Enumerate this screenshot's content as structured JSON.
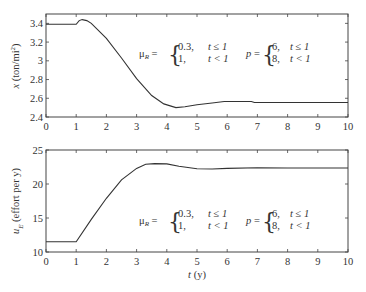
{
  "chart_data": [
    {
      "type": "line",
      "title": "",
      "xlabel": "",
      "ylabel": "x (ton/mi²)",
      "ylabel_main": "x",
      "ylabel_unit": " (ton/mi",
      "ylabel_sup": "2",
      "ylabel_close": ")",
      "xlim": [
        0,
        10
      ],
      "ylim": [
        2.4,
        3.5
      ],
      "xticks": [
        0,
        1,
        2,
        3,
        4,
        5,
        6,
        7,
        8,
        9,
        10
      ],
      "xtick_labels": [
        "0",
        "1",
        "2",
        "3",
        "4",
        "5",
        "6",
        "7",
        "8",
        "9",
        "10"
      ],
      "yticks": [
        2.4,
        2.6,
        2.8,
        3.0,
        3.2,
        3.4
      ],
      "ytick_labels": [
        "2.4",
        "2.6",
        "2.8",
        "3",
        "3.2",
        "3.4"
      ],
      "grid": false,
      "series": [
        {
          "name": "x",
          "x": [
            0,
            1.0,
            1.1,
            1.2,
            1.35,
            1.5,
            2.0,
            2.5,
            3.0,
            3.5,
            3.9,
            4.3,
            4.6,
            5.0,
            5.5,
            5.9,
            6.8,
            6.9,
            10
          ],
          "y": [
            3.39,
            3.39,
            3.43,
            3.44,
            3.43,
            3.4,
            3.24,
            3.03,
            2.81,
            2.63,
            2.54,
            2.5,
            2.51,
            2.53,
            2.55,
            2.565,
            2.565,
            2.555,
            2.555
          ]
        }
      ],
      "annotations": {
        "mu_label": "μ",
        "mu_sub": "R",
        "mu_eq": " =",
        "mu_cases": [
          [
            "0.3,",
            "t ≤ 1"
          ],
          [
            "1,",
            "t < 1"
          ]
        ],
        "p_label": "p",
        "p_eq": " =",
        "p_cases": [
          [
            "6,",
            "t ≤ 1"
          ],
          [
            "8,",
            "t < 1"
          ]
        ]
      }
    },
    {
      "type": "line",
      "title": "",
      "xlabel": "t (y)",
      "xlabel_var": "t",
      "xlabel_unit": " (y)",
      "ylabel": "u_E (effort per y)",
      "ylabel_main": "u",
      "ylabel_sub": "E",
      "ylabel_unit": " (effort per y)",
      "xlim": [
        0,
        10
      ],
      "ylim": [
        10,
        25
      ],
      "xticks": [
        0,
        1,
        2,
        3,
        4,
        5,
        6,
        7,
        8,
        9,
        10
      ],
      "xtick_labels": [
        "0",
        "1",
        "2",
        "3",
        "4",
        "5",
        "6",
        "7",
        "8",
        "9",
        "10"
      ],
      "yticks": [
        10,
        15,
        20,
        25
      ],
      "ytick_labels": [
        "10",
        "15",
        "20",
        "25"
      ],
      "grid": false,
      "series": [
        {
          "name": "u_E",
          "x": [
            0,
            1.0,
            1.5,
            2.0,
            2.5,
            3.0,
            3.3,
            3.6,
            4.0,
            4.4,
            5.0,
            5.5,
            6.0,
            7.0,
            8.0,
            10
          ],
          "y": [
            11.5,
            11.5,
            14.8,
            17.9,
            20.6,
            22.3,
            22.9,
            23.0,
            22.95,
            22.6,
            22.25,
            22.2,
            22.3,
            22.4,
            22.35,
            22.35
          ]
        }
      ],
      "annotations": {
        "mu_label": "μ",
        "mu_sub": "R",
        "mu_eq": " =",
        "mu_cases": [
          [
            "0.3,",
            "t ≤ 1"
          ],
          [
            "1,",
            "t < 1"
          ]
        ],
        "p_label": "p",
        "p_eq": " =",
        "p_cases": [
          [
            "6,",
            "t ≤ 1"
          ],
          [
            "8,",
            "t < 1"
          ]
        ]
      }
    }
  ],
  "colors": {
    "line": "#333333",
    "axis": "#444444",
    "text": "#333333"
  }
}
